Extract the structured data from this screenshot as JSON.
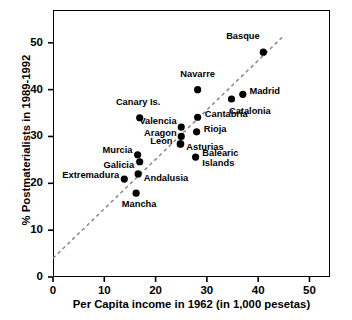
{
  "chart_data": {
    "type": "scatter",
    "title": "",
    "xlabel": "Per Capita income in 1962 (in 1,000 pesetas)",
    "ylabel": "% Postmaterialists in 1989-1992",
    "xlim": [
      0,
      54
    ],
    "ylim": [
      0,
      57
    ],
    "xticks": [
      0,
      10,
      20,
      30,
      40,
      50
    ],
    "yticks": [
      0,
      10,
      20,
      30,
      40,
      50
    ],
    "xtick_labels": [
      "0",
      "10",
      "20",
      "30",
      "40",
      "50"
    ],
    "ytick_labels": [
      "0",
      "10",
      "20",
      "30",
      "40",
      "50"
    ],
    "grid": false,
    "legend": null,
    "marker": "filled-circle",
    "marker_color": "#000000",
    "points": [
      {
        "label": "Basque",
        "x": 41.0,
        "y": 48.0,
        "label_pos": "above-left",
        "lx": 40.3,
        "ly": 51.3,
        "align": "r",
        "lines": [
          "Basque"
        ]
      },
      {
        "label": "Madrid",
        "x": 37.0,
        "y": 39.0,
        "label_pos": "right",
        "lx": 38.3,
        "ly": 39.5,
        "align": "l",
        "lines": [
          "Madrid"
        ]
      },
      {
        "label": "Catalonia",
        "x": 34.8,
        "y": 38.0,
        "label_pos": "below-right",
        "lx": 34.3,
        "ly": 35.3,
        "align": "l",
        "lines": [
          "Catalonia"
        ]
      },
      {
        "label": "Navarre",
        "x": 28.2,
        "y": 40.0,
        "label_pos": "above",
        "lx": 28.2,
        "ly": 43.1,
        "align": "c",
        "lines": [
          "Navarre"
        ]
      },
      {
        "label": "Cantabria",
        "x": 28.2,
        "y": 34.1,
        "label_pos": "right",
        "lx": 29.6,
        "ly": 34.5,
        "align": "l",
        "lines": [
          "Cantabria"
        ]
      },
      {
        "label": "Rioja",
        "x": 28.0,
        "y": 31.0,
        "label_pos": "right",
        "lx": 29.4,
        "ly": 31.4,
        "align": "l",
        "lines": [
          "Rioja"
        ]
      },
      {
        "label": "Canary Is.",
        "x": 16.9,
        "y": 34.0,
        "label_pos": "above",
        "lx": 16.6,
        "ly": 37.1,
        "align": "c",
        "lines": [
          "Canary Is."
        ]
      },
      {
        "label": "Valencia",
        "x": 25.0,
        "y": 32.0,
        "label_pos": "left",
        "lx": 24.1,
        "ly": 33.0,
        "align": "r",
        "lines": [
          "Valencia"
        ]
      },
      {
        "label": "Aragon",
        "x": 25.0,
        "y": 30.0,
        "label_pos": "left",
        "lx": 24.1,
        "ly": 30.6,
        "align": "r",
        "lines": [
          "Aragon"
        ]
      },
      {
        "label": "Leon",
        "x": 24.8,
        "y": 28.4,
        "label_pos": "left",
        "lx": 23.3,
        "ly": 28.9,
        "align": "r",
        "lines": [
          "Leon"
        ]
      },
      {
        "label": "Asturias",
        "x": 24.9,
        "y": 28.4,
        "label_pos": "right",
        "lx": 26.0,
        "ly": 27.6,
        "align": "l",
        "lines": [
          "Asturias"
        ]
      },
      {
        "label": "Balearic Islands",
        "x": 27.8,
        "y": 25.6,
        "label_pos": "right",
        "lx": 29.1,
        "ly": 26.2,
        "align": "l",
        "lines": [
          "Balearic",
          "Islands"
        ]
      },
      {
        "label": "Murcia",
        "x": 16.5,
        "y": 26.1,
        "label_pos": "left",
        "lx": 15.5,
        "ly": 26.8,
        "align": "r",
        "lines": [
          "Murcia"
        ]
      },
      {
        "label": "Galicia",
        "x": 16.9,
        "y": 24.6,
        "label_pos": "left",
        "lx": 15.8,
        "ly": 23.8,
        "align": "r",
        "lines": [
          "Galicia"
        ]
      },
      {
        "label": "Andalusia",
        "x": 16.6,
        "y": 22.0,
        "label_pos": "right",
        "lx": 17.7,
        "ly": 20.9,
        "align": "l",
        "lines": [
          "Andalusia"
        ]
      },
      {
        "label": "Extremadura",
        "x": 13.9,
        "y": 20.9,
        "label_pos": "left",
        "lx": 12.9,
        "ly": 21.6,
        "align": "r",
        "lines": [
          "Extremadura"
        ]
      },
      {
        "label": "Mancha",
        "x": 16.2,
        "y": 17.9,
        "label_pos": "below",
        "lx": 16.8,
        "ly": 15.4,
        "align": "c",
        "lines": [
          "Mancha"
        ]
      }
    ],
    "trendline": {
      "style": "dashed",
      "color": "#888888",
      "x0": 0.0,
      "y0": 4.0,
      "x1": 44.7,
      "y1": 51.2
    }
  },
  "axes": {
    "x_title": "Per Capita income in 1962 (in 1,000 pesetas)",
    "y_title": "% Postmaterialists in 1989-1992"
  }
}
